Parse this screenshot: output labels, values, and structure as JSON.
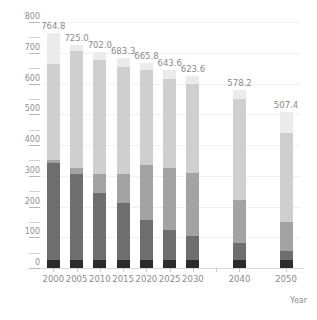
{
  "chart_data": {
    "type": "bar",
    "stacked": true,
    "title": "",
    "subtitle": "",
    "xlabel": "Year",
    "ylabel": "",
    "ylim": [
      0,
      800
    ],
    "ytick_step": 100,
    "yminor_step": 50,
    "grid": true,
    "legend": "none",
    "categories": [
      "2000",
      "2005",
      "2010",
      "2015",
      "2020",
      "2025",
      "2030",
      "2040",
      "2050"
    ],
    "x_positions": [
      2000,
      2005,
      2010,
      2015,
      2020,
      2025,
      2030,
      2040,
      2050
    ],
    "ytick_labels": [
      "0",
      "100",
      "200",
      "300",
      "400",
      "500",
      "600",
      "700",
      "800"
    ],
    "totals": [
      764.8,
      725.0,
      702.0,
      683.3,
      665.8,
      643.6,
      623.6,
      578.2,
      507.4
    ],
    "total_labels": [
      "764.8",
      "725.0",
      "702.0",
      "683.3",
      "665.8",
      "643.6",
      "623.6",
      "578.2",
      "507.4"
    ],
    "series": [
      {
        "name": "segment-1",
        "color": "#2b2b2b",
        "values": [
          25.0,
          25.0,
          25.0,
          25.0,
          25.0,
          25.0,
          25.0,
          25.0,
          25.0
        ]
      },
      {
        "name": "segment-2",
        "color": "#6e6e6e",
        "values": [
          315.0,
          280.0,
          220.0,
          185.0,
          130.0,
          100.0,
          80.0,
          55.0,
          30.0
        ]
      },
      {
        "name": "segment-3",
        "color": "#a3a3a3",
        "values": [
          10.0,
          20.0,
          60.0,
          95.0,
          180.0,
          200.0,
          205.0,
          140.0,
          95.0
        ]
      },
      {
        "name": "segment-4",
        "color": "#cfcfcf",
        "values": [
          314.8,
          380.0,
          370.0,
          350.0,
          310.0,
          290.0,
          290.0,
          330.0,
          290.0
        ]
      },
      {
        "name": "segment-5",
        "color": "#ebebeb",
        "values": [
          100.0,
          20.0,
          27.0,
          28.3,
          20.8,
          28.6,
          23.6,
          28.2,
          67.4
        ]
      }
    ],
    "colors": {
      "background": "#ffffff",
      "grid": "#f0f0f0",
      "axis": "#d9d9d9",
      "text": "#8a8a8a"
    }
  }
}
